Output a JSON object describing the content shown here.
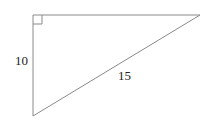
{
  "diagram": {
    "type": "right-triangle",
    "vertices": {
      "right_angle": {
        "x": 33,
        "y": 15
      },
      "top_right": {
        "x": 200,
        "y": 15
      },
      "bottom": {
        "x": 33,
        "y": 116
      }
    },
    "labels": {
      "vertical_leg": "10",
      "hypotenuse": "15"
    },
    "right_angle_marker": true,
    "stroke_color": "#8a8a8a"
  }
}
